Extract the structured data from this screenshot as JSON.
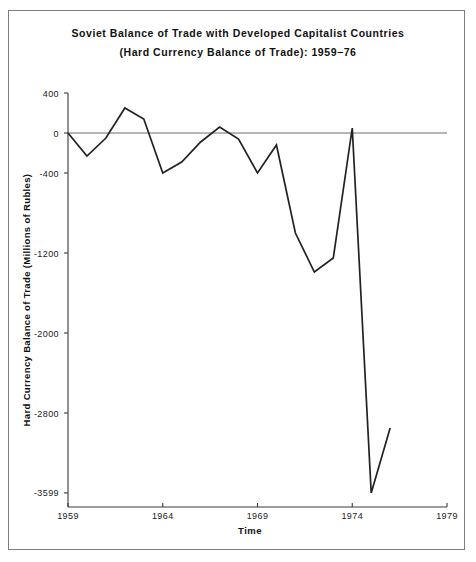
{
  "chart_data": {
    "type": "line",
    "title": "Soviet Balance of Trade with Developed Capitalist Countries",
    "subtitle": "(Hard Currency Balance of Trade):  1959−76",
    "xlabel": "Time",
    "ylabel": "Hard Currency Balance of Trade (Millions of Rubles)",
    "x": [
      1959,
      1960,
      1961,
      1962,
      1963,
      1964,
      1965,
      1966,
      1967,
      1968,
      1969,
      1970,
      1971,
      1972,
      1973,
      1974,
      1975,
      1976
    ],
    "values": [
      0,
      -230,
      -50,
      250,
      140,
      -400,
      -290,
      -90,
      60,
      -60,
      -400,
      -120,
      -1000,
      -1390,
      -1250,
      50,
      -3599,
      -2950
    ],
    "xlim": [
      1959,
      1979
    ],
    "ylim": [
      -3599,
      400
    ],
    "xticks": [
      1959,
      1964,
      1969,
      1974,
      1979
    ],
    "xtick_labels": [
      "1959",
      "1964",
      "1969",
      "1974",
      "1979"
    ],
    "yticks": [
      400,
      0,
      -400,
      -1200,
      -2000,
      -2800,
      -3599
    ],
    "ytick_labels": [
      "400",
      "0",
      "-400",
      "-1200",
      "-2000",
      "-2800",
      "-3599"
    ],
    "grid": false,
    "legend": false,
    "zero_reference_line": true,
    "line_color": "#222222",
    "axis_color": "#3a3a3a",
    "background_color": "#ffffff"
  }
}
